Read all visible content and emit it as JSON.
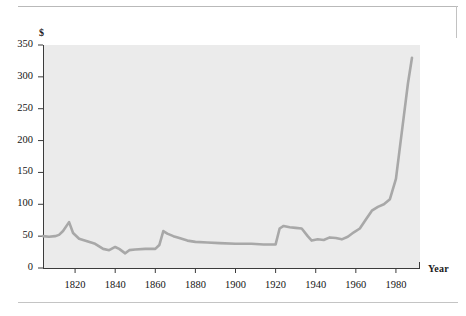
{
  "figure": {
    "name": "price-index-line-chart",
    "background_color": "#ffffff",
    "plot_background_color": "#ebebeb",
    "line_color": "#a8a8a8",
    "rule_color": "#b9b9b9"
  },
  "chart_data": {
    "type": "line",
    "title": "",
    "subtitle": "",
    "xlabel": "Year",
    "ylabel": "$",
    "xlim": [
      1804,
      1992
    ],
    "ylim": [
      0,
      350
    ],
    "grid": false,
    "legend": null,
    "legend_position": "none",
    "xticks": [
      1820,
      1840,
      1860,
      1880,
      1900,
      1920,
      1940,
      1960,
      1980
    ],
    "xtick_labels": [
      "1820",
      "1840",
      "1860",
      "1880",
      "1900",
      "1920",
      "1940",
      "1960",
      "1980"
    ],
    "yticks": [
      0,
      50,
      100,
      150,
      200,
      250,
      300,
      350
    ],
    "ytick_labels": [
      "0",
      "50",
      "100",
      "150",
      "200",
      "250",
      "300",
      "350"
    ],
    "series": [
      {
        "name": "price",
        "color": "#a8a8a8",
        "x": [
          1804,
          1807,
          1810,
          1812,
          1814,
          1817,
          1819,
          1822,
          1826,
          1830,
          1834,
          1837,
          1840,
          1842,
          1845,
          1847,
          1850,
          1855,
          1860,
          1862,
          1864,
          1866,
          1869,
          1872,
          1876,
          1880,
          1886,
          1892,
          1900,
          1908,
          1914,
          1918,
          1920,
          1922,
          1924,
          1927,
          1930,
          1933,
          1936,
          1938,
          1941,
          1944,
          1947,
          1950,
          1953,
          1956,
          1959,
          1962,
          1965,
          1968,
          1971,
          1974,
          1977,
          1980,
          1982,
          1984,
          1986,
          1988
        ],
        "values": [
          50,
          49,
          50,
          52,
          58,
          72,
          55,
          46,
          42,
          38,
          30,
          28,
          33,
          30,
          23,
          28,
          29,
          30,
          30,
          36,
          58,
          54,
          50,
          47,
          43,
          41,
          40,
          39,
          38,
          38,
          37,
          37,
          37,
          62,
          66,
          64,
          63,
          62,
          50,
          43,
          45,
          44,
          48,
          47,
          45,
          49,
          56,
          62,
          76,
          90,
          96,
          100,
          108,
          140,
          190,
          240,
          290,
          330
        ]
      }
    ],
    "annotations": []
  },
  "labels": {
    "y_axis_title": "$",
    "x_axis_title": "Year"
  }
}
